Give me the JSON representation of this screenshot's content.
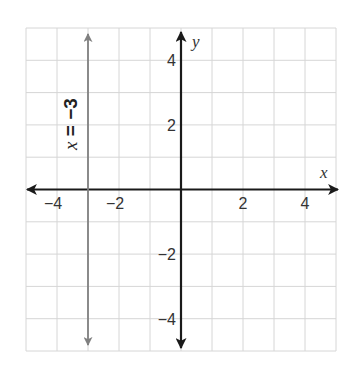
{
  "chart_data": {
    "type": "line",
    "title": "",
    "xlabel": "x",
    "ylabel": "y",
    "xlim": [
      -5,
      5
    ],
    "ylim": [
      -5,
      5
    ],
    "grid": true,
    "x_ticks": [
      {
        "value": -4,
        "label": "−4"
      },
      {
        "value": -2,
        "label": "−2"
      },
      {
        "value": 2,
        "label": "2"
      },
      {
        "value": 4,
        "label": "4"
      }
    ],
    "y_ticks": [
      {
        "value": 4,
        "label": "4"
      },
      {
        "value": 2,
        "label": "2"
      },
      {
        "value": -2,
        "label": "−2"
      },
      {
        "value": -4,
        "label": "−4"
      }
    ],
    "series": [
      {
        "name": "x = −3",
        "kind": "vertical-line",
        "x": -3,
        "points": [
          [
            -3,
            -5
          ],
          [
            -3,
            5
          ]
        ],
        "color": "#808080",
        "arrows": "both"
      }
    ],
    "annotations": [
      {
        "text": "x = −3",
        "x": -3.6,
        "y": 2.8,
        "rotation": -90
      }
    ]
  },
  "labels": {
    "x_axis": "x",
    "y_axis": "y",
    "equation_var": "x",
    "equation_rest": " = −3"
  },
  "colors": {
    "grid": "#d6d6d6",
    "axes": "#1a1a1a",
    "line": "#808080",
    "background": "#ffffff"
  }
}
